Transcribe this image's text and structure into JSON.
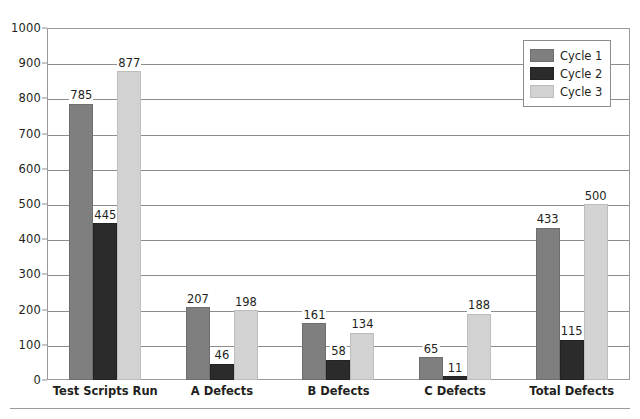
{
  "chart_data": {
    "type": "bar",
    "title": "",
    "xlabel": "",
    "ylabel": "",
    "ylim": [
      0,
      1000
    ],
    "ytick_step": 100,
    "yticks": [
      0,
      100,
      200,
      300,
      400,
      500,
      600,
      700,
      800,
      900,
      1000
    ],
    "grid": true,
    "grid_axis": "y",
    "legend_position": "top-right-inside",
    "categories": [
      "Test Scripts Run",
      "A Defects",
      "B Defects",
      "C Defects",
      "Total Defects"
    ],
    "series": [
      {
        "name": "Cycle 1",
        "color": "#7f7f7f",
        "values": [
          785,
          207,
          161,
          65,
          433
        ]
      },
      {
        "name": "Cycle 2",
        "color": "#2b2b2b",
        "values": [
          445,
          46,
          58,
          11,
          115
        ]
      },
      {
        "name": "Cycle 3",
        "color": "#d2d2d2",
        "values": [
          877,
          198,
          134,
          188,
          500
        ]
      }
    ],
    "data_labels": [
      [
        "785",
        "445",
        "877"
      ],
      [
        "207",
        "46",
        "198"
      ],
      [
        "161",
        "58",
        "134"
      ],
      [
        "65",
        "11",
        "188"
      ],
      [
        "433",
        "115",
        "500"
      ]
    ]
  },
  "legend": {
    "entries": [
      {
        "label": "Cycle 1",
        "color": "#7f7f7f"
      },
      {
        "label": "Cycle 2",
        "color": "#2b2b2b"
      },
      {
        "label": "Cycle 3",
        "color": "#d2d2d2"
      }
    ]
  },
  "axis": {
    "y_tick_labels": [
      "1000",
      "900",
      "800",
      "700",
      "600",
      "500",
      "400",
      "300",
      "200",
      "100",
      "0"
    ],
    "x_tick_labels": [
      "Test Scripts Run",
      "A Defects",
      "B Defects",
      "C Defects",
      "Total Defects"
    ]
  },
  "style": {
    "background": "#ffffff",
    "axis_color": "#8d8d8d",
    "text_color": "#231f20"
  }
}
